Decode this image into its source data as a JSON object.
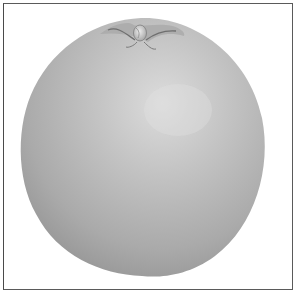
{
  "image": {
    "subject": "citrus fruit illustration",
    "style": "grayscale",
    "colors": {
      "background": "#ffffff",
      "frame": "#555555",
      "fruit_light": "#d9d9d9",
      "fruit_mid": "#b4b4b4",
      "fruit_dark": "#8f8f8f",
      "stem": "#cfcfcf",
      "stem_shadow": "#6e6e6e"
    }
  }
}
